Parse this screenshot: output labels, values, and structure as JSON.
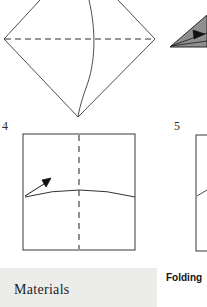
{
  "page": {
    "width": 207,
    "height": 307,
    "background": "#ffffff",
    "type": "origami-instruction-figure-page-crop"
  },
  "steps": [
    {
      "id": "step-3-diamond",
      "number_label": "",
      "caption": "",
      "shape": "diamond-with-horizontal-dashed-crease-and-vertical-curved-fold-line",
      "note": "top figure, partially cropped at top edge"
    },
    {
      "id": "step-4-square",
      "number_label": "4",
      "caption": "",
      "shape": "square-with-vertical-dashed-center-crease-and-curved-valley-fold-arrow"
    },
    {
      "id": "step-5-square",
      "number_label": "5",
      "caption": "",
      "shape": "square-cropped-at-right-edge-with-short-diagonal-line"
    },
    {
      "id": "shaded-triangle",
      "number_label": "",
      "caption": "",
      "shape": "gray-shaded-triangle-with-arrow-cropped-at-right-edge"
    }
  ],
  "labels": {
    "step4": "4",
    "step5": "5",
    "materials": "Materials",
    "folding": "Folding"
  },
  "colors": {
    "ink": "#333333",
    "line": "#444444",
    "band_background": "#ececeb",
    "shade_fill": "#8c8c8c",
    "shade_stroke": "#2b2b2b",
    "page_background": "#ffffff",
    "text": "#1c1c1c"
  },
  "geometry": {
    "diamond": {
      "left_vertex": [
        4,
        39
      ],
      "right_vertex": [
        155,
        39
      ],
      "bottom_vertex": [
        78,
        117
      ],
      "dashed_crease_y": 39,
      "curve_top": [
        89,
        0
      ],
      "curve_bottom": [
        78,
        117
      ]
    },
    "square4": {
      "x": 23,
      "y": 134,
      "w": 112,
      "h": 116,
      "dashed_center_x": 79,
      "arc_from": [
        25,
        197
      ],
      "arc_peak": [
        79,
        187
      ],
      "arc_to": [
        135,
        197
      ],
      "arrow_tip": [
        50,
        179
      ],
      "arrow_tail": [
        25,
        196
      ]
    },
    "square5": {
      "x": 196,
      "y": 135,
      "w": 60,
      "h": 116
    },
    "shaded_triangle": {
      "apex": [
        170,
        47
      ],
      "top_right": [
        207,
        17
      ],
      "bottom_right": [
        207,
        47
      ]
    }
  }
}
